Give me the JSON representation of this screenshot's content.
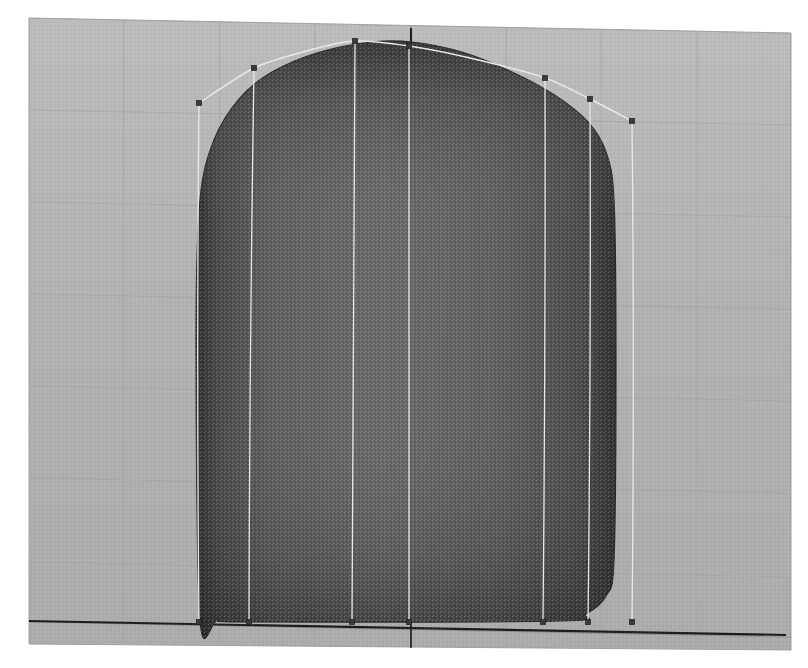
{
  "app": {
    "kind": "3d-cad-viewport",
    "view_label": "Perspective",
    "display_mode": "Shaded"
  },
  "colors": {
    "page_background": "#ffffff",
    "ground_plane": "#b2b2b2",
    "ground_plane_edge": "#9a9a9a",
    "grid_line_minor": "#a6a6a6",
    "grid_line_major": "#8f8f8f",
    "axis_line": "#1c1c1c",
    "surface_light": "#6d6d6d",
    "surface_mid": "#5c5c5c",
    "surface_dark": "#3f3f3f",
    "surface_edge": "#2b2b2b",
    "control_curve": "#e8e8e8",
    "control_point": "#3a3a3a",
    "control_point_stroke": "#1e1e1e"
  },
  "ground": {
    "name": "construction-plane-grid",
    "corners": {
      "top_left": [
        29,
        18
      ],
      "top_right": [
        791,
        33
      ],
      "bottom_right": [
        791,
        650
      ],
      "bottom_left": [
        29,
        644
      ]
    },
    "grid_columns_x": [
      29,
      124,
      220,
      315,
      411,
      506,
      601,
      697,
      791
    ],
    "grid_rows_y": [
      18,
      110,
      202,
      294,
      386,
      478,
      562,
      622,
      650
    ],
    "major_row_index": 7,
    "major_col_index": 4
  },
  "axes": {
    "x_axis": {
      "name": "x-axis",
      "from": [
        29,
        621
      ],
      "to": [
        786,
        635
      ]
    },
    "y_axis": {
      "name": "y-axis",
      "from": [
        411,
        28
      ],
      "to": [
        411,
        56
      ]
    },
    "origin_marker": [
      411,
      624
    ]
  },
  "surface": {
    "name": "nurbs-surface",
    "label": "Rounded rectangular shell",
    "outline_points": [
      [
        200,
        620
      ],
      [
        196,
        340
      ],
      [
        200,
        200
      ],
      [
        214,
        140
      ],
      [
        240,
        98
      ],
      [
        272,
        72
      ],
      [
        320,
        52
      ],
      [
        372,
        42
      ],
      [
        412,
        42
      ],
      [
        462,
        52
      ],
      [
        512,
        72
      ],
      [
        556,
        96
      ],
      [
        588,
        122
      ],
      [
        606,
        152
      ],
      [
        614,
        200
      ],
      [
        616,
        360
      ],
      [
        614,
        560
      ],
      [
        606,
        596
      ],
      [
        586,
        614
      ],
      [
        560,
        621
      ],
      [
        250,
        622
      ],
      [
        218,
        620
      ]
    ],
    "corner_radius_top_left": 58,
    "corner_radius_bottom_left": 42,
    "corner_radius_bottom_right": 38
  },
  "control_cage": {
    "name": "control-point-cage",
    "isocurves": [
      {
        "id": "iso-1",
        "top": [
          199,
          103
        ],
        "bottom": [
          199,
          622
        ]
      },
      {
        "id": "iso-2",
        "top": [
          254,
          68
        ],
        "bottom": [
          249,
          622
        ]
      },
      {
        "id": "iso-3",
        "top": [
          355,
          41
        ],
        "bottom": [
          352,
          622
        ]
      },
      {
        "id": "iso-4",
        "top": [
          409,
          46
        ],
        "bottom": [
          409,
          622
        ]
      },
      {
        "id": "iso-5",
        "top": [
          545,
          78
        ],
        "bottom": [
          543,
          622
        ]
      },
      {
        "id": "iso-6",
        "top": [
          590,
          99
        ],
        "bottom": [
          588,
          622
        ]
      },
      {
        "id": "iso-7",
        "top": [
          632,
          121
        ],
        "bottom": [
          632,
          622
        ]
      }
    ],
    "top_spline": [
      [
        199,
        103
      ],
      [
        254,
        68
      ],
      [
        310,
        50
      ],
      [
        355,
        41
      ],
      [
        409,
        46
      ],
      [
        470,
        58
      ],
      [
        545,
        78
      ],
      [
        590,
        99
      ],
      [
        632,
        121
      ]
    ],
    "control_points": [
      {
        "id": "cp-1",
        "x": 199,
        "y": 103
      },
      {
        "id": "cp-2",
        "x": 254,
        "y": 68
      },
      {
        "id": "cp-3",
        "x": 355,
        "y": 41
      },
      {
        "id": "cp-4",
        "x": 409,
        "y": 46
      },
      {
        "id": "cp-5",
        "x": 545,
        "y": 78
      },
      {
        "id": "cp-6",
        "x": 590,
        "y": 99
      },
      {
        "id": "cp-7",
        "x": 632,
        "y": 121
      },
      {
        "id": "cp-8",
        "x": 199,
        "y": 622
      },
      {
        "id": "cp-9",
        "x": 249,
        "y": 622
      },
      {
        "id": "cp-10",
        "x": 352,
        "y": 622
      },
      {
        "id": "cp-11",
        "x": 409,
        "y": 622
      },
      {
        "id": "cp-12",
        "x": 543,
        "y": 622
      },
      {
        "id": "cp-13",
        "x": 588,
        "y": 622
      },
      {
        "id": "cp-14",
        "x": 632,
        "y": 622
      }
    ],
    "control_point_size": 5
  }
}
